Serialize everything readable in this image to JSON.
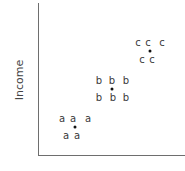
{
  "chart_data": {
    "type": "scatter",
    "title": "",
    "xlabel": "",
    "ylabel": "Income",
    "grid": false,
    "legend": "none",
    "series": [
      {
        "name": "a",
        "marker": "a",
        "points_px": [
          [
            62,
            119
          ],
          [
            73,
            119
          ],
          [
            88,
            119
          ],
          [
            66,
            136
          ],
          [
            77,
            136
          ]
        ],
        "centroid_px": [
          75,
          127
        ]
      },
      {
        "name": "b",
        "marker": "b",
        "points_px": [
          [
            99,
            81
          ],
          [
            112,
            81
          ],
          [
            126,
            81
          ],
          [
            99,
            98
          ],
          [
            113,
            98
          ],
          [
            126,
            98
          ]
        ],
        "centroid_px": [
          112,
          89
        ]
      },
      {
        "name": "c",
        "marker": "c",
        "points_px": [
          [
            138,
            43
          ],
          [
            148,
            43
          ],
          [
            162,
            43
          ],
          [
            142,
            60
          ],
          [
            152,
            60
          ]
        ],
        "centroid_px": [
          150,
          51
        ]
      }
    ]
  },
  "labels": {
    "ylabel": "Income",
    "xlabel": ""
  }
}
